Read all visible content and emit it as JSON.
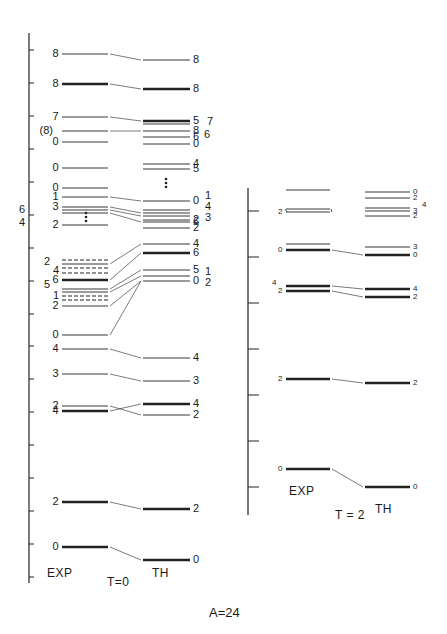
{
  "figure": {
    "title": "A=24",
    "panels": [
      {
        "id": "T0",
        "isospin_label": "T=0",
        "exp_label": "EXP",
        "th_label": "TH",
        "axis": {
          "x": 29,
          "y_top": 33,
          "y_bottom": 583,
          "ticks": [
            50,
            83,
            116,
            149,
            182,
            215,
            248,
            281,
            314,
            346,
            379,
            412,
            445,
            478,
            511,
            544,
            577
          ]
        },
        "exp_x": [
          62,
          108
        ],
        "th_x": [
          143,
          190
        ],
        "exp_levels": [
          {
            "y": 54,
            "label": "8",
            "weight": "thin"
          },
          {
            "y": 84,
            "label": "8",
            "weight": "thick"
          },
          {
            "y": 117,
            "label": "7",
            "weight": "thin"
          },
          {
            "y": 131,
            "label": "(8)",
            "weight": "thin"
          },
          {
            "y": 142,
            "label": "0",
            "weight": "thin"
          },
          {
            "y": 168,
            "label": "0",
            "weight": "thin"
          },
          {
            "y": 188,
            "label": "0",
            "weight": "thin"
          },
          {
            "y": 197,
            "label": "1",
            "weight": "thin"
          },
          {
            "y": 207,
            "label": "3",
            "weight": "thin"
          },
          {
            "y": 210,
            "label": "",
            "weight": "thin"
          },
          {
            "y": 213,
            "label": "",
            "weight": "thin"
          },
          {
            "y": 225,
            "label": "2",
            "weight": "thin"
          },
          {
            "y": 260,
            "label": "",
            "weight": "dashed"
          },
          {
            "y": 264,
            "label": "",
            "weight": "thin"
          },
          {
            "y": 268,
            "label": "",
            "weight": "dashed"
          },
          {
            "y": 273,
            "label": "",
            "weight": "dashed"
          },
          {
            "y": 280,
            "label": "6",
            "weight": "thick"
          },
          {
            "y": 289,
            "label": "",
            "weight": "thin"
          },
          {
            "y": 292,
            "label": "",
            "weight": "thin"
          },
          {
            "y": 296,
            "label": "",
            "weight": "dashed"
          },
          {
            "y": 300,
            "label": "",
            "weight": "dashed"
          },
          {
            "y": 306,
            "label": "2",
            "weight": "thin"
          },
          {
            "y": 335,
            "label": "0",
            "weight": "thin"
          },
          {
            "y": 349,
            "label": "4",
            "weight": "thin"
          },
          {
            "y": 374,
            "label": "3",
            "weight": "thin"
          },
          {
            "y": 406,
            "label": "2",
            "weight": "thin"
          },
          {
            "y": 411,
            "label": "4",
            "weight": "thick"
          },
          {
            "y": 502,
            "label": "2",
            "weight": "thick"
          },
          {
            "y": 547,
            "label": "0",
            "weight": "thick"
          }
        ],
        "exp_side_labels": [
          {
            "x": 19,
            "y": 210,
            "text": "6"
          },
          {
            "x": 19,
            "y": 223,
            "text": "4"
          },
          {
            "x": 44,
            "y": 262,
            "text": "2"
          },
          {
            "x": 53,
            "y": 271,
            "text": "4"
          },
          {
            "x": 44,
            "y": 285,
            "text": "5"
          },
          {
            "x": 53,
            "y": 296,
            "text": "1"
          }
        ],
        "exp_dots": {
          "x": 86,
          "y": [
            213,
            217,
            221
          ]
        },
        "th_levels": [
          {
            "y": 60,
            "label": "8",
            "weight": "thin"
          },
          {
            "y": 89,
            "label": "8",
            "weight": "thick"
          },
          {
            "y": 121,
            "label": "5",
            "weight": "thick"
          },
          {
            "y": 124,
            "label": "",
            "weight": "thin"
          },
          {
            "y": 131,
            "label": "8",
            "weight": "thin"
          },
          {
            "y": 137,
            "label": "6",
            "weight": "thin"
          },
          {
            "y": 144,
            "label": "0",
            "weight": "thin"
          },
          {
            "y": 164,
            "label": "4",
            "weight": "thin"
          },
          {
            "y": 169,
            "label": "5",
            "weight": "thin"
          },
          {
            "y": 220,
            "label": "2",
            "weight": "thin"
          },
          {
            "y": 201,
            "label": "0",
            "weight": "thin"
          },
          {
            "y": 210,
            "label": "",
            "weight": "thin"
          },
          {
            "y": 213,
            "label": "",
            "weight": "thin"
          },
          {
            "y": 216,
            "label": "",
            "weight": "thin"
          },
          {
            "y": 222,
            "label": "6",
            "weight": "thin"
          },
          {
            "y": 228,
            "label": "2",
            "weight": "thin"
          },
          {
            "y": 244,
            "label": "4",
            "weight": "thin"
          },
          {
            "y": 253,
            "label": "6",
            "weight": "thick"
          },
          {
            "y": 270,
            "label": "5",
            "weight": "thin"
          },
          {
            "y": 276,
            "label": "",
            "weight": "thin"
          },
          {
            "y": 281,
            "label": "0",
            "weight": "thin"
          },
          {
            "y": 358,
            "label": "4",
            "weight": "thin"
          },
          {
            "y": 381,
            "label": "3",
            "weight": "thin"
          },
          {
            "y": 404,
            "label": "4",
            "weight": "thick"
          },
          {
            "y": 415,
            "label": "2",
            "weight": "thin"
          },
          {
            "y": 509,
            "label": "2",
            "weight": "thick"
          },
          {
            "y": 560,
            "label": "0",
            "weight": "thick"
          }
        ],
        "th_side_labels": [
          {
            "x": 207,
            "y": 122,
            "text": "7"
          },
          {
            "x": 204,
            "y": 135,
            "text": "6"
          },
          {
            "x": 205,
            "y": 196,
            "text": "1"
          },
          {
            "x": 205,
            "y": 207,
            "text": "4"
          },
          {
            "x": 205,
            "y": 218,
            "text": "3"
          },
          {
            "x": 205,
            "y": 272,
            "text": "1"
          },
          {
            "x": 205,
            "y": 283,
            "text": "2"
          }
        ],
        "th_dots": {
          "x": 166,
          "y": [
            179,
            183,
            187
          ]
        },
        "connectors": [
          [
            108,
            54,
            143,
            60
          ],
          [
            108,
            84,
            143,
            89
          ],
          [
            108,
            117,
            143,
            121
          ],
          [
            108,
            131,
            143,
            131
          ],
          [
            108,
            197,
            143,
            201
          ],
          [
            108,
            207,
            143,
            213
          ],
          [
            108,
            210,
            143,
            216
          ],
          [
            108,
            213,
            143,
            222
          ],
          [
            108,
            264,
            143,
            244
          ],
          [
            108,
            280,
            143,
            253
          ],
          [
            108,
            289,
            143,
            270
          ],
          [
            108,
            292,
            143,
            276
          ],
          [
            108,
            306,
            143,
            281
          ],
          [
            108,
            335,
            143,
            281
          ],
          [
            108,
            349,
            143,
            358
          ],
          [
            108,
            374,
            143,
            381
          ],
          [
            108,
            406,
            143,
            415
          ],
          [
            108,
            411,
            143,
            404
          ],
          [
            108,
            502,
            143,
            509
          ],
          [
            108,
            547,
            143,
            560
          ]
        ]
      },
      {
        "id": "T2",
        "isospin_label": "T = 2",
        "exp_label": "EXP",
        "th_label": "TH",
        "axis": {
          "x": 248,
          "y_top": 188,
          "y_bottom": 515,
          "ticks": [
            211,
            257,
            303,
            349,
            395,
            441,
            487
          ]
        },
        "exp_x": [
          286,
          330
        ],
        "th_x": [
          365,
          410
        ],
        "exp_levels": [
          {
            "y": 190,
            "label": "",
            "weight": "thin"
          },
          {
            "y": 209,
            "label": "",
            "weight": "thin"
          },
          {
            "y": 212,
            "label": "2",
            "weight": "thin"
          },
          {
            "y": 244,
            "label": "",
            "weight": "thin"
          },
          {
            "y": 250,
            "label": "0",
            "weight": "thick"
          },
          {
            "y": 286,
            "label": "",
            "weight": "thick"
          },
          {
            "y": 291,
            "label": "2",
            "weight": "thick"
          },
          {
            "y": 379,
            "label": "2",
            "weight": "thick"
          },
          {
            "y": 469,
            "label": "0",
            "weight": "thick"
          }
        ],
        "th_levels": [
          {
            "y": 192,
            "label": "0",
            "weight": "thin"
          },
          {
            "y": 198,
            "label": "2",
            "weight": "thin"
          },
          {
            "y": 208,
            "label": "",
            "weight": "thin"
          },
          {
            "y": 211,
            "label": "3",
            "weight": "thin"
          },
          {
            "y": 216,
            "label": "2",
            "weight": "thin"
          },
          {
            "y": 247,
            "label": "3",
            "weight": "thin"
          },
          {
            "y": 255,
            "label": "0",
            "weight": "thick"
          },
          {
            "y": 289,
            "label": "4",
            "weight": "thick"
          },
          {
            "y": 297,
            "label": "2",
            "weight": "thick"
          },
          {
            "y": 383,
            "label": "2",
            "weight": "thick"
          },
          {
            "y": 487,
            "label": "0",
            "weight": "thick"
          }
        ],
        "exp_side_labels": [
          {
            "x": 272,
            "y": 283,
            "text": "4"
          }
        ],
        "th_side_labels": [
          {
            "x": 422,
            "y": 205,
            "text": "4"
          }
        ],
        "connectors": [
          [
            330,
            250,
            365,
            255
          ],
          [
            330,
            286,
            365,
            289
          ],
          [
            330,
            291,
            365,
            297
          ],
          [
            330,
            379,
            365,
            383
          ],
          [
            330,
            469,
            365,
            487
          ]
        ]
      }
    ]
  }
}
